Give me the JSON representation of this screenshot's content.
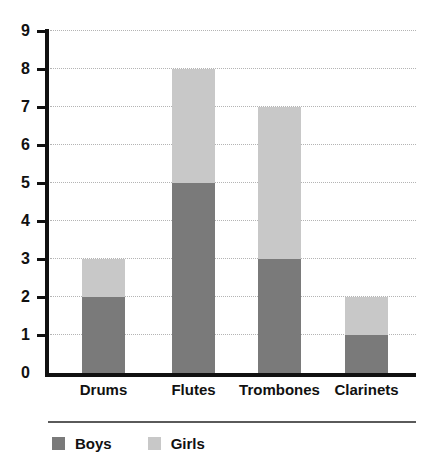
{
  "chart_data": {
    "type": "bar",
    "subtype": "stacked-bar",
    "title": "",
    "subtitle": "",
    "xlabel": "",
    "ylabel": "",
    "categories": [
      "Drums",
      "Flutes",
      "Trombones",
      "Clarinets"
    ],
    "series": [
      {
        "name": "Boys",
        "color": "#7a7a7a",
        "values": [
          2,
          5,
          3,
          1
        ]
      },
      {
        "name": "Girls",
        "color": "#c8c8c8",
        "values": [
          1,
          3,
          4,
          1
        ]
      }
    ],
    "totals": [
      3,
      8,
      7,
      2
    ],
    "ylim": [
      0,
      9
    ],
    "y_ticks": [
      0,
      1,
      2,
      3,
      4,
      5,
      6,
      7,
      8,
      9
    ],
    "y_tick_labels": [
      "0",
      "1",
      "2",
      "3",
      "4",
      "5",
      "6",
      "7",
      "8",
      "9"
    ],
    "grid": true,
    "grid_style": "dotted",
    "grid_color": "#b4b4b4",
    "legend": true,
    "legend_position": "bottom-left",
    "axis_color": "#111111",
    "background": "#ffffff"
  },
  "legend": {
    "entries": [
      {
        "label": "Boys",
        "color": "#7a7a7a"
      },
      {
        "label": "Girls",
        "color": "#c8c8c8"
      }
    ]
  }
}
